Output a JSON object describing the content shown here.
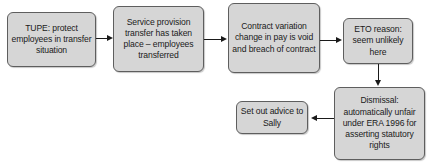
{
  "diagram": {
    "background_color": "#ffffff",
    "node_fill_color": "#d6d6d6",
    "node_border_color": "#5e5e5e",
    "connector_color": "#1a1a1a",
    "nodes": [
      {
        "id": "tupe",
        "label": "TUPE: protect employees in transfer situation"
      },
      {
        "id": "service",
        "label": "Service provision transfer has taken place – employees transferred"
      },
      {
        "id": "contract",
        "label": "Contract variation change in pay is void and breach of contract"
      },
      {
        "id": "eto",
        "label": "ETO reason: seem unlikely here"
      },
      {
        "id": "dismissal",
        "label": "Dismissal: automatically unfair under ERA 1996 for asserting statutory rights"
      },
      {
        "id": "advice",
        "label": "Set out advice to Sally"
      }
    ],
    "connectors": [
      {
        "id": "edge1",
        "from": "tupe",
        "to": "service",
        "direction": "right"
      },
      {
        "id": "edge2",
        "from": "service",
        "to": "contract",
        "direction": "right"
      },
      {
        "id": "edge3",
        "from": "contract",
        "to": "eto",
        "direction": "right"
      },
      {
        "id": "edge4",
        "from": "eto",
        "to": "dismissal",
        "direction": "down"
      },
      {
        "id": "edge5",
        "from": "dismissal",
        "to": "advice",
        "direction": "left"
      }
    ]
  }
}
